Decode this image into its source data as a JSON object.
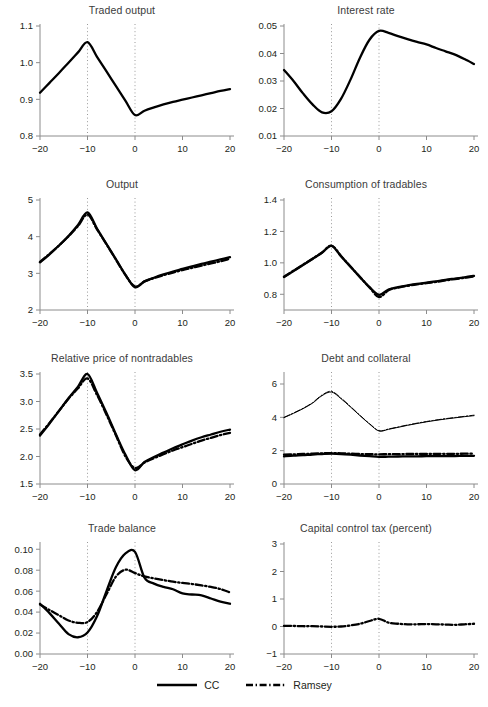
{
  "figure": {
    "title": "",
    "legend": [
      {
        "label": "CC",
        "style": "solid"
      },
      {
        "label": "Ramsey",
        "style": "dashdot"
      }
    ]
  },
  "chart_data": [
    {
      "type": "line",
      "title": "Traded output",
      "xlabel": "",
      "ylabel": "",
      "xlim": [
        -20,
        20
      ],
      "ylim": [
        0.8,
        1.1
      ],
      "xticks": [
        -20,
        -10,
        0,
        10,
        20
      ],
      "xticklabels": [
        "−20",
        "−10",
        "0",
        "10",
        "20"
      ],
      "yticks": [
        0.8,
        0.9,
        1.0,
        1.1
      ],
      "yticklabels": [
        "0.8",
        "0.9",
        "1.0",
        "1.1"
      ],
      "grid": false,
      "vlines": [
        -10,
        0
      ],
      "legend_position": "figure-bottom",
      "x": [
        -20,
        -18,
        -16,
        -14,
        -12,
        -10,
        -8,
        -6,
        -4,
        -2,
        0,
        2,
        4,
        6,
        8,
        10,
        12,
        14,
        16,
        18,
        20
      ],
      "series": [
        {
          "name": "CC",
          "style": "solid",
          "values": [
            0.918,
            0.945,
            0.972,
            1.0,
            1.028,
            1.056,
            1.016,
            0.976,
            0.936,
            0.896,
            0.857,
            0.869,
            0.878,
            0.886,
            0.893,
            0.899,
            0.905,
            0.911,
            0.917,
            0.923,
            0.928
          ]
        }
      ]
    },
    {
      "type": "line",
      "title": "Interest rate",
      "xlabel": "",
      "ylabel": "",
      "xlim": [
        -20,
        20
      ],
      "ylim": [
        0.01,
        0.05
      ],
      "xticks": [
        -20,
        -10,
        0,
        10,
        20
      ],
      "xticklabels": [
        "−20",
        "−10",
        "0",
        "10",
        "20"
      ],
      "yticks": [
        0.01,
        0.02,
        0.03,
        0.04,
        0.05
      ],
      "yticklabels": [
        "0.01",
        "0.02",
        "0.03",
        "0.04",
        "0.05"
      ],
      "grid": false,
      "vlines": [
        -10,
        0
      ],
      "legend_position": "figure-bottom",
      "x": [
        -20,
        -18,
        -16,
        -14,
        -12,
        -10,
        -8,
        -6,
        -4,
        -2,
        0,
        2,
        4,
        6,
        8,
        10,
        12,
        14,
        16,
        18,
        20
      ],
      "series": [
        {
          "name": "CC",
          "style": "solid",
          "values": [
            0.034,
            0.03,
            0.0255,
            0.0215,
            0.0186,
            0.019,
            0.0235,
            0.0305,
            0.0385,
            0.045,
            0.0482,
            0.0475,
            0.0463,
            0.0452,
            0.0442,
            0.0433,
            0.042,
            0.0408,
            0.0396,
            0.038,
            0.0362
          ]
        }
      ]
    },
    {
      "type": "line",
      "title": "Output",
      "xlabel": "",
      "ylabel": "",
      "xlim": [
        -20,
        20
      ],
      "ylim": [
        2,
        5
      ],
      "xticks": [
        -20,
        -10,
        0,
        10,
        20
      ],
      "xticklabels": [
        "−20",
        "−10",
        "0",
        "10",
        "20"
      ],
      "yticks": [
        2,
        3,
        4,
        5
      ],
      "yticklabels": [
        "2",
        "3",
        "4",
        "5"
      ],
      "grid": false,
      "vlines": [
        -10,
        0
      ],
      "legend_position": "figure-bottom",
      "x": [
        -20,
        -18,
        -16,
        -14,
        -12,
        -10,
        -8,
        -6,
        -4,
        -2,
        0,
        2,
        4,
        6,
        8,
        10,
        12,
        14,
        16,
        18,
        20
      ],
      "series": [
        {
          "name": "CC",
          "style": "solid",
          "values": [
            3.3,
            3.52,
            3.76,
            4.02,
            4.32,
            4.66,
            4.22,
            3.8,
            3.38,
            2.96,
            2.62,
            2.78,
            2.88,
            2.97,
            3.05,
            3.12,
            3.19,
            3.26,
            3.32,
            3.38,
            3.44
          ]
        },
        {
          "name": "Ramsey",
          "style": "dashdot",
          "values": [
            3.31,
            3.53,
            3.76,
            4.01,
            4.29,
            4.6,
            4.2,
            3.79,
            3.37,
            2.95,
            2.64,
            2.78,
            2.87,
            2.95,
            3.02,
            3.09,
            3.15,
            3.21,
            3.27,
            3.33,
            3.4
          ]
        }
      ]
    },
    {
      "type": "line",
      "title": "Consumption of tradables",
      "xlabel": "",
      "ylabel": "",
      "xlim": [
        -20,
        20
      ],
      "ylim": [
        0.7,
        1.4
      ],
      "xticks": [
        -20,
        -10,
        0,
        10,
        20
      ],
      "xticklabels": [
        "−20",
        "−10",
        "0",
        "10",
        "20"
      ],
      "yticks": [
        0.8,
        1.0,
        1.2,
        1.4
      ],
      "yticklabels": [
        "0.8",
        "1.0",
        "1.2",
        "1.4"
      ],
      "grid": false,
      "vlines": [
        -10,
        0
      ],
      "legend_position": "figure-bottom",
      "x": [
        -20,
        -18,
        -16,
        -14,
        -12,
        -10,
        -8,
        -6,
        -4,
        -2,
        0,
        2,
        4,
        6,
        8,
        10,
        12,
        14,
        16,
        18,
        20
      ],
      "series": [
        {
          "name": "CC",
          "style": "solid",
          "values": [
            0.91,
            0.948,
            0.986,
            1.025,
            1.064,
            1.108,
            1.042,
            0.975,
            0.909,
            0.845,
            0.797,
            0.83,
            0.845,
            0.856,
            0.866,
            0.874,
            0.882,
            0.892,
            0.9,
            0.908,
            0.917
          ]
        },
        {
          "name": "Ramsey",
          "style": "dashdot",
          "values": [
            0.912,
            0.95,
            0.988,
            1.026,
            1.066,
            1.11,
            1.044,
            0.977,
            0.91,
            0.844,
            0.782,
            0.826,
            0.842,
            0.854,
            0.863,
            0.871,
            0.879,
            0.888,
            0.897,
            0.905,
            0.914
          ]
        }
      ]
    },
    {
      "type": "line",
      "title": "Relative price of nontradables",
      "xlabel": "",
      "ylabel": "",
      "xlim": [
        -20,
        20
      ],
      "ylim": [
        1.5,
        3.5
      ],
      "xticks": [
        -20,
        -10,
        0,
        10,
        20
      ],
      "xticklabels": [
        "−20",
        "−10",
        "0",
        "10",
        "20"
      ],
      "yticks": [
        1.5,
        2.0,
        2.5,
        3.0,
        3.5
      ],
      "yticklabels": [
        "1.5",
        "2.0",
        "2.5",
        "3.0",
        "3.5"
      ],
      "grid": false,
      "vlines": [
        -10,
        0
      ],
      "legend_position": "figure-bottom",
      "x": [
        -20,
        -18,
        -16,
        -14,
        -12,
        -10,
        -8,
        -6,
        -4,
        -2,
        0,
        2,
        4,
        6,
        8,
        10,
        12,
        14,
        16,
        18,
        20
      ],
      "series": [
        {
          "name": "CC",
          "style": "solid",
          "values": [
            2.38,
            2.6,
            2.83,
            3.06,
            3.27,
            3.5,
            3.16,
            2.79,
            2.4,
            2.03,
            1.75,
            1.9,
            1.99,
            2.07,
            2.15,
            2.22,
            2.29,
            2.35,
            2.4,
            2.45,
            2.49
          ]
        },
        {
          "name": "Ramsey",
          "style": "dashdot",
          "values": [
            2.4,
            2.61,
            2.83,
            3.05,
            3.24,
            3.42,
            3.12,
            2.76,
            2.38,
            2.0,
            1.79,
            1.89,
            1.97,
            2.04,
            2.11,
            2.17,
            2.23,
            2.29,
            2.34,
            2.39,
            2.43
          ]
        }
      ]
    },
    {
      "type": "line",
      "title": "Debt and collateral",
      "xlabel": "",
      "ylabel": "",
      "xlim": [
        -20,
        20
      ],
      "ylim": [
        0,
        6.6
      ],
      "xticks": [
        -20,
        -10,
        0,
        10,
        20
      ],
      "xticklabels": [
        "−20",
        "−10",
        "0",
        "10",
        "20"
      ],
      "yticks": [
        0,
        2,
        4,
        6
      ],
      "yticklabels": [
        "0",
        "2",
        "4",
        "6"
      ],
      "grid": false,
      "vlines": [
        -10,
        0
      ],
      "legend_position": "figure-bottom",
      "x": [
        -20,
        -18,
        -16,
        -14,
        -12,
        -10,
        -8,
        -6,
        -4,
        -2,
        0,
        2,
        4,
        6,
        8,
        10,
        12,
        14,
        16,
        18,
        20
      ],
      "series": [
        {
          "name": "Debt CC",
          "style": "solid-thin",
          "values": [
            3.98,
            4.24,
            4.52,
            4.85,
            5.3,
            5.52,
            5.12,
            4.62,
            4.1,
            3.6,
            3.18,
            3.28,
            3.4,
            3.52,
            3.63,
            3.73,
            3.82,
            3.9,
            3.97,
            4.04,
            4.1
          ]
        },
        {
          "name": "Debt Ramsey",
          "style": "dashdot-thin",
          "values": [
            4.0,
            4.26,
            4.54,
            4.88,
            5.34,
            5.56,
            5.16,
            4.65,
            4.12,
            3.62,
            3.2,
            3.3,
            3.42,
            3.54,
            3.65,
            3.75,
            3.84,
            3.92,
            3.99,
            4.06,
            4.13
          ]
        },
        {
          "name": "Collateral CC",
          "style": "solid",
          "values": [
            1.66,
            1.7,
            1.73,
            1.77,
            1.8,
            1.82,
            1.8,
            1.76,
            1.71,
            1.67,
            1.63,
            1.64,
            1.65,
            1.66,
            1.66,
            1.67,
            1.67,
            1.68,
            1.68,
            1.69,
            1.69
          ]
        },
        {
          "name": "Collateral Ramsey",
          "style": "dashdot",
          "values": [
            1.76,
            1.78,
            1.8,
            1.82,
            1.84,
            1.85,
            1.84,
            1.82,
            1.8,
            1.79,
            1.78,
            1.79,
            1.79,
            1.8,
            1.8,
            1.8,
            1.81,
            1.81,
            1.81,
            1.82,
            1.82
          ]
        }
      ]
    },
    {
      "type": "line",
      "title": "Trade balance",
      "xlabel": "",
      "ylabel": "",
      "xlim": [
        -20,
        20
      ],
      "ylim": [
        0.0,
        0.105
      ],
      "xticks": [
        -20,
        -10,
        0,
        10,
        20
      ],
      "xticklabels": [
        "−20",
        "−10",
        "0",
        "10",
        "20"
      ],
      "yticks": [
        0.0,
        0.02,
        0.04,
        0.06,
        0.08,
        0.1
      ],
      "yticklabels": [
        "0.00",
        "0.02",
        "0.04",
        "0.06",
        "0.08",
        "0.10"
      ],
      "grid": false,
      "vlines": [
        -10,
        0
      ],
      "legend_position": "figure-bottom",
      "x": [
        -20,
        -18,
        -16,
        -14,
        -12,
        -10,
        -8,
        -6,
        -4,
        -2,
        0,
        2,
        4,
        6,
        8,
        10,
        12,
        14,
        16,
        18,
        20
      ],
      "series": [
        {
          "name": "CC",
          "style": "solid",
          "values": [
            0.048,
            0.039,
            0.0288,
            0.019,
            0.016,
            0.0205,
            0.036,
            0.06,
            0.083,
            0.096,
            0.0975,
            0.0728,
            0.0672,
            0.064,
            0.0618,
            0.0578,
            0.0568,
            0.056,
            0.053,
            0.05,
            0.048
          ]
        },
        {
          "name": "Ramsey",
          "style": "dashdot",
          "values": [
            0.0472,
            0.042,
            0.037,
            0.032,
            0.0298,
            0.0305,
            0.04,
            0.057,
            0.074,
            0.0805,
            0.0772,
            0.074,
            0.0722,
            0.0706,
            0.069,
            0.0678,
            0.0668,
            0.0655,
            0.064,
            0.062,
            0.0588
          ]
        }
      ]
    },
    {
      "type": "line",
      "title": "Capital control tax (percent)",
      "xlabel": "",
      "ylabel": "",
      "xlim": [
        -20,
        20
      ],
      "ylim": [
        -1,
        3
      ],
      "xticks": [
        -20,
        -10,
        0,
        10,
        20
      ],
      "xticklabels": [
        "−20",
        "−10",
        "0",
        "10",
        "20"
      ],
      "yticks": [
        -1,
        0,
        1,
        2,
        3
      ],
      "yticklabels": [
        "−1",
        "0",
        "1",
        "2",
        "3"
      ],
      "grid": false,
      "vlines": [
        -10,
        0
      ],
      "legend_position": "figure-bottom",
      "x": [
        -20,
        -18,
        -16,
        -14,
        -12,
        -10,
        -8,
        -6,
        -4,
        -2,
        0,
        2,
        4,
        6,
        8,
        10,
        12,
        14,
        16,
        18,
        20
      ],
      "series": [
        {
          "name": "Ramsey",
          "style": "dashdot",
          "values": [
            0.02,
            0.02,
            0.01,
            0.01,
            0.0,
            -0.01,
            0.0,
            0.04,
            0.1,
            0.2,
            0.28,
            0.14,
            0.1,
            0.08,
            0.08,
            0.09,
            0.08,
            0.07,
            0.06,
            0.08,
            0.1
          ]
        }
      ]
    }
  ]
}
